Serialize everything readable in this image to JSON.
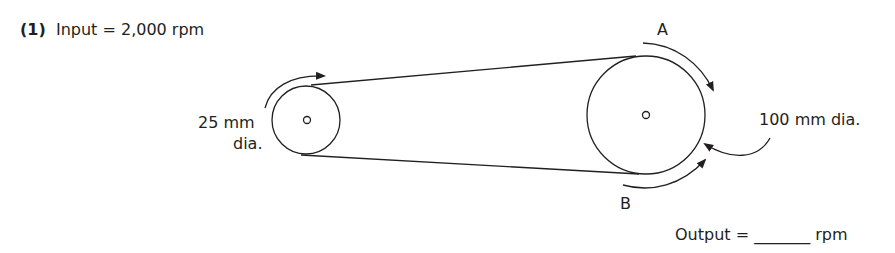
{
  "question": {
    "number": "(1)",
    "input_label": "Input = 2,000 rpm"
  },
  "driver_pulley": {
    "label_line1": "25 mm",
    "label_line2": "dia."
  },
  "driven_pulley": {
    "label": "100 mm dia.",
    "point_a": "A",
    "point_b": "B"
  },
  "answer": {
    "label": "Output =",
    "blank": "_______",
    "unit": "rpm"
  },
  "colors": {
    "ink": "#231f20",
    "background": "#ffffff"
  }
}
